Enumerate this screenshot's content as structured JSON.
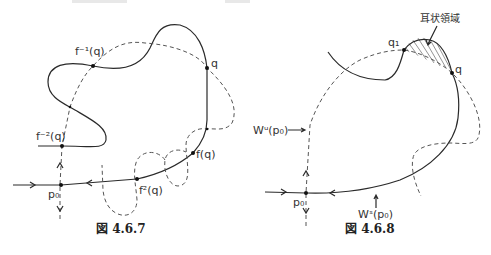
{
  "figures": [
    {
      "caption": "図 4.6.7",
      "labels": {
        "f_inv1": "f⁻¹(q)",
        "q": "q",
        "f_inv2": "f⁻²(q)",
        "fq": "f(q)",
        "f2q": "f²(q)",
        "p0": "p₀"
      }
    },
    {
      "caption": "図 4.6.8",
      "labels": {
        "region": "耳状領域",
        "q1": "q₁",
        "q": "q",
        "wu": "Wᵘ(p₀)",
        "ws": "Wˢ(p₀)",
        "p0": "p₀"
      }
    }
  ],
  "colors": {
    "stroke": "#2a2a2a",
    "dashed": "#555555",
    "background": "#ffffff"
  }
}
